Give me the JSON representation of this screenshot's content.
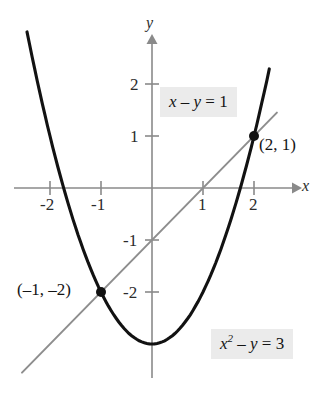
{
  "figure": {
    "kind": "coordinate-graph",
    "background": "#ffffff"
  },
  "axes": {
    "x_label": "x",
    "y_label": "y",
    "x_ticks": [
      "-2",
      "-1",
      "1",
      "2"
    ],
    "y_ticks": [
      "2",
      "1",
      "-1",
      "-2"
    ],
    "axis_color": "#8a8a8a"
  },
  "labels": {
    "equation_line": {
      "x": "x",
      "minus": " – ",
      "y": "y",
      "equals": " = ",
      "value": "1",
      "full": "x – y = 1"
    },
    "equation_parabola": {
      "x": "x",
      "exp": "2",
      "minus": " – ",
      "y": "y",
      "equals": " = ",
      "value": "3",
      "full": "x² – y = 3"
    },
    "point_upper": "(2, 1)",
    "point_lower": "(–1, –2)"
  },
  "chart_data": {
    "type": "line",
    "title": "",
    "xlabel": "x",
    "ylabel": "y",
    "xlim": [
      -2.6,
      2.9
    ],
    "ylim": [
      -4.6,
      2.8
    ],
    "grid": false,
    "legend": "none",
    "xticks": [
      -2,
      -1,
      1,
      2
    ],
    "yticks": [
      2,
      1,
      -1,
      -2
    ],
    "series": [
      {
        "name": "x² – y = 3",
        "equation": "y = x^2 - 3",
        "color": "#121212",
        "type": "parabola",
        "x": [
          -2.45,
          -2.2,
          -2.0,
          -1.75,
          -1.5,
          -1.25,
          -1.0,
          -0.75,
          -0.5,
          -0.25,
          0.0,
          0.25,
          0.5,
          0.75,
          1.0,
          1.25,
          1.5,
          1.75,
          2.0,
          2.2,
          2.3
        ],
        "y": [
          3.0,
          1.84,
          1.0,
          0.0625,
          -0.75,
          -1.4375,
          -2.0,
          -2.4375,
          -2.75,
          -2.9375,
          -3.0,
          -2.9375,
          -2.75,
          -2.4375,
          -2.0,
          -1.4375,
          -0.75,
          0.0625,
          1.0,
          1.84,
          2.29
        ]
      },
      {
        "name": "x – y = 1",
        "equation": "y = x - 1",
        "color": "#8e8e8e",
        "type": "line",
        "x": [
          -2.55,
          2.45
        ],
        "y": [
          -3.55,
          1.45
        ]
      }
    ],
    "points": [
      {
        "label": "(2, 1)",
        "x": 2,
        "y": 1
      },
      {
        "label": "(–1, –2)",
        "x": -1,
        "y": -2
      }
    ],
    "annotations": [
      {
        "text": "x – y = 1",
        "x": 0.2,
        "y": 1.55
      },
      {
        "text": "x² – y = 3",
        "x": 1.2,
        "y": -2.9
      }
    ]
  }
}
